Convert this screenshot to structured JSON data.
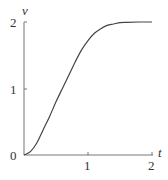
{
  "chart_data": {
    "type": "line",
    "title": "",
    "xlabel": "t",
    "ylabel": "v",
    "xlim": [
      0,
      2
    ],
    "ylim": [
      0,
      2
    ],
    "grid": false,
    "legend": null,
    "x_ticks": [
      "1",
      "2"
    ],
    "y_ticks": [
      "0",
      "1",
      "2"
    ],
    "series": [
      {
        "name": "v(t)",
        "x": [
          0,
          0.1,
          0.2,
          0.3,
          0.4,
          0.5,
          0.6,
          0.7,
          0.8,
          0.9,
          1.0,
          1.1,
          1.2,
          1.3,
          1.4,
          1.5,
          1.6,
          1.8,
          2.0
        ],
        "values": [
          0,
          0.05,
          0.18,
          0.38,
          0.58,
          0.8,
          1.0,
          1.2,
          1.4,
          1.58,
          1.72,
          1.83,
          1.9,
          1.95,
          1.97,
          1.99,
          1.995,
          2.0,
          2.0
        ]
      }
    ],
    "color": "#444444"
  },
  "axes": {
    "x_label": "t",
    "y_label": "v",
    "origin_label": "0",
    "x_tick_1": "1",
    "x_tick_2": "2",
    "y_tick_1": "1",
    "y_tick_2": "2"
  }
}
